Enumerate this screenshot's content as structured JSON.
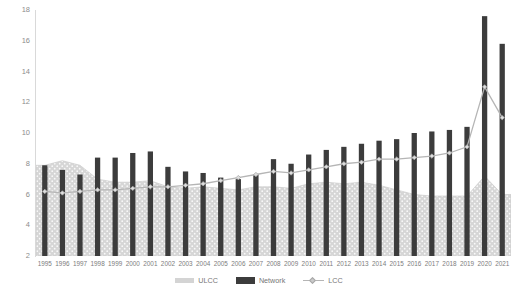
{
  "chart_data": {
    "type": "bar",
    "title": "",
    "xlabel": "",
    "ylabel": "",
    "ylim": [
      2,
      18
    ],
    "y_ticks": [
      2,
      4,
      6,
      8,
      10,
      12,
      14,
      16,
      18
    ],
    "grid": false,
    "legend_position": "bottom",
    "categories": [
      "1995",
      "1996",
      "1997",
      "1998",
      "1999",
      "2000",
      "2001",
      "2002",
      "2003",
      "2004",
      "2005",
      "2006",
      "2007",
      "2008",
      "2009",
      "2010",
      "2011",
      "2012",
      "2013",
      "2014",
      "2015",
      "2016",
      "2017",
      "2018",
      "2019",
      "2020",
      "2021"
    ],
    "series": [
      {
        "name": "ULCC",
        "render": "area",
        "color": "#d4d4d4",
        "values": [
          7.9,
          8.2,
          7.9,
          7.0,
          6.8,
          6.8,
          6.9,
          6.5,
          6.4,
          6.5,
          6.4,
          6.3,
          6.5,
          6.5,
          6.4,
          6.7,
          6.8,
          6.7,
          6.8,
          6.6,
          6.3,
          6.0,
          5.9,
          5.9,
          5.9,
          7.2,
          6.0
        ]
      },
      {
        "name": "Network",
        "render": "bar",
        "color": "#3c3c3c",
        "values": [
          7.9,
          7.6,
          7.3,
          8.4,
          8.4,
          8.7,
          8.8,
          7.8,
          7.5,
          7.4,
          7.1,
          7.0,
          7.3,
          8.3,
          8.0,
          8.6,
          8.9,
          9.1,
          9.3,
          9.5,
          9.6,
          10.0,
          10.1,
          10.2,
          10.4,
          17.6,
          15.8
        ]
      },
      {
        "name": "LCC",
        "render": "line",
        "color": "#b5b5b5",
        "values": [
          6.2,
          6.1,
          6.2,
          6.3,
          6.3,
          6.4,
          6.5,
          6.5,
          6.6,
          6.7,
          6.9,
          7.1,
          7.3,
          7.5,
          7.4,
          7.6,
          7.8,
          8.0,
          8.1,
          8.3,
          8.3,
          8.4,
          8.5,
          8.7,
          9.1,
          13.0,
          11.0
        ]
      }
    ]
  },
  "legend": {
    "items": [
      {
        "label": "ULCC",
        "kind": "area"
      },
      {
        "label": "Network",
        "kind": "bar"
      },
      {
        "label": "LCC",
        "kind": "line"
      }
    ]
  },
  "colors": {
    "area_fill": "#d4d4d4",
    "bar": "#3c3c3c",
    "line": "#b5b5b5",
    "axis": "#d9d9d9",
    "tick_text": "#8c8c8c"
  }
}
